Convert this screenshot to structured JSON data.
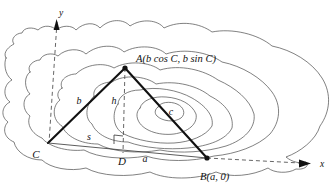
{
  "figure": {
    "axes": {
      "y_label": "y",
      "x_label": "x"
    },
    "vertices": [
      {
        "key": "A",
        "label": "A(b cos C, b sin C)",
        "short": "A",
        "x": 125,
        "y": 68
      },
      {
        "key": "B",
        "label": "B(a, 0)",
        "short": "B",
        "x": 207,
        "y": 158
      },
      {
        "key": "C",
        "label": "C",
        "short": "C",
        "x": 48,
        "y": 143
      }
    ],
    "side_labels": [
      {
        "key": "b",
        "label": "b"
      },
      {
        "key": "a",
        "label": "a"
      },
      {
        "key": "c",
        "label": "c"
      },
      {
        "key": "h",
        "label": "h"
      },
      {
        "key": "s",
        "label": "s"
      }
    ],
    "foot_label": "D",
    "colors": {
      "contour": "#4a4a4a",
      "triangle": "#111111",
      "dashed": "#555555",
      "background": "#ffffff"
    }
  }
}
